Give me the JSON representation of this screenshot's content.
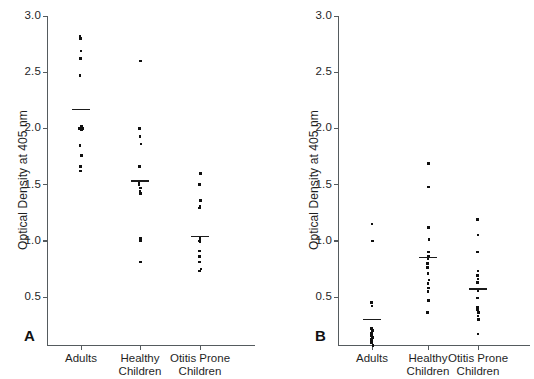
{
  "figure": {
    "y_axis_title": "Optical Density at 405 nm",
    "y_ticks": [
      "3.0",
      "2.5",
      "2.0",
      "1.5",
      "1.0",
      "0.5"
    ],
    "y_tick_values": [
      3.0,
      2.5,
      2.0,
      1.5,
      1.0,
      0.5
    ],
    "group_labels_line1": [
      "Adults",
      "Healthy",
      "Otitis Prone"
    ],
    "group_labels_line2": [
      "",
      "Children",
      "Children"
    ],
    "panel_a_letter": "A",
    "panel_b_letter": "B",
    "caption": ""
  },
  "chart_data": [
    {
      "type": "scatter",
      "panel": "A",
      "title": "",
      "xlabel": "",
      "ylabel": "Optical Density at 405 nm",
      "ylim": [
        0.075,
        3.0
      ],
      "grid": false,
      "legend": "none",
      "categories": [
        "Adults",
        "Healthy Children",
        "Otitis Prone Children"
      ],
      "series": [
        {
          "name": "Adults",
          "values": [
            2.82,
            2.8,
            2.69,
            2.62,
            2.47,
            2.02,
            2.01,
            2.0,
            2.0,
            1.99,
            1.85,
            1.76,
            1.66,
            1.62
          ],
          "mean": 2.17
        },
        {
          "name": "Healthy Children",
          "values": [
            2.6,
            2.0,
            1.93,
            1.86,
            1.66,
            1.52,
            1.5,
            1.47,
            1.44,
            1.42,
            1.02,
            1.01,
            1.0,
            0.81
          ],
          "mean": 1.53
        },
        {
          "name": "Otitis Prone Children",
          "values": [
            1.6,
            1.5,
            1.36,
            1.31,
            1.29,
            1.02,
            1.01,
            1.0,
            0.99,
            0.91,
            0.86,
            0.81,
            0.75,
            0.73
          ],
          "mean": 1.04
        }
      ]
    },
    {
      "type": "scatter",
      "panel": "B",
      "title": "",
      "xlabel": "",
      "ylabel": "Optical Density at 405 nm",
      "ylim": [
        0.075,
        3.0
      ],
      "grid": false,
      "legend": "none",
      "categories": [
        "Adults",
        "Healthy Children",
        "Otitis Prone Children"
      ],
      "series": [
        {
          "name": "Adults",
          "values": [
            1.15,
            1.0,
            0.45,
            0.42,
            0.22,
            0.2,
            0.18,
            0.16,
            0.14,
            0.13,
            0.12,
            0.1,
            0.09,
            0.07
          ],
          "mean": 0.3
        },
        {
          "name": "Healthy Children",
          "values": [
            1.69,
            1.48,
            1.12,
            1.01,
            0.9,
            0.86,
            0.84,
            0.8,
            0.76,
            0.71,
            0.65,
            0.62,
            0.58,
            0.55,
            0.47,
            0.36
          ],
          "mean": 0.85
        },
        {
          "name": "Otitis Prone Children",
          "values": [
            1.19,
            1.05,
            0.9,
            0.73,
            0.69,
            0.66,
            0.63,
            0.56,
            0.49,
            0.41,
            0.39,
            0.38,
            0.36,
            0.33,
            0.3,
            0.17
          ],
          "mean": 0.57
        }
      ]
    }
  ]
}
